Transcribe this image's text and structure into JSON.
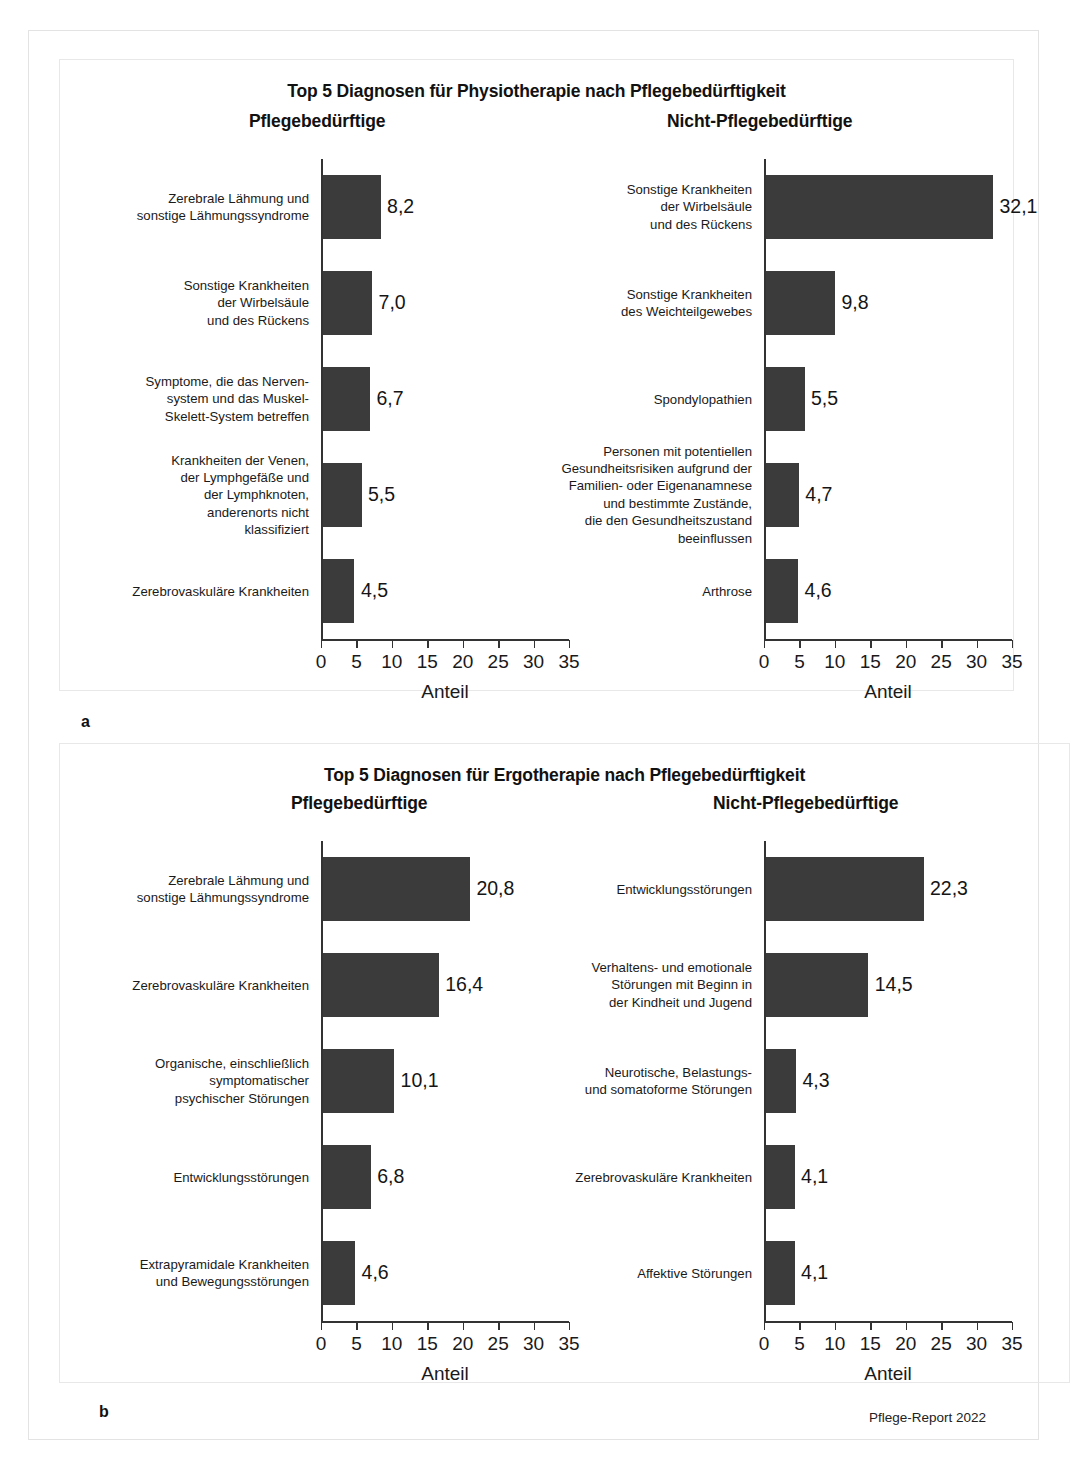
{
  "figure": {
    "source_note": "Pflege-Report 2022",
    "panel_a_letter": "a",
    "panel_b_letter": "b",
    "axis_title": "Anteil",
    "tick_labels": [
      "0",
      "5",
      "10",
      "15",
      "20",
      "25",
      "30",
      "35"
    ],
    "group_left": "Pflegebedürftige",
    "group_right": "Nicht-Pflegebedürftige",
    "bar_color": "#3b3b3b",
    "axis_color": "#333333"
  },
  "chart_data": [
    {
      "type": "bar",
      "orientation": "horizontal",
      "panel": "a",
      "subpanel": "left",
      "title": "Top 5 Diagnosen für Physiotherapie nach Pflegebedürftigkeit",
      "subtitle": "Pflegebedürftige",
      "xlabel": "Anteil",
      "ylabel": "",
      "xlim": [
        0,
        35
      ],
      "xticks": [
        0,
        5,
        10,
        15,
        20,
        25,
        30,
        35
      ],
      "grid": false,
      "legend": null,
      "categories": [
        "Zerebrale Lähmung und\nsonstige Lähmungssyndrome",
        "Sonstige Krankheiten\nder Wirbelsäule\nund des Rückens",
        "Symptome, die das Nerven-\nsystem und das Muskel-\nSkelett-System betreffen",
        "Krankheiten der Venen,\nder Lymphgefäße und\nder Lymphknoten,\nanderenorts nicht\nklassifiziert",
        "Zerebrovaskuläre Krankheiten"
      ],
      "values": [
        8.2,
        7.0,
        6.7,
        5.5,
        4.5
      ],
      "value_labels": [
        "8,2",
        "7,0",
        "6,7",
        "5,5",
        "4,5"
      ]
    },
    {
      "type": "bar",
      "orientation": "horizontal",
      "panel": "a",
      "subpanel": "right",
      "title": "Top 5 Diagnosen für Physiotherapie nach Pflegebedürftigkeit",
      "subtitle": "Nicht-Pflegebedürftige",
      "xlabel": "Anteil",
      "ylabel": "",
      "xlim": [
        0,
        35
      ],
      "xticks": [
        0,
        5,
        10,
        15,
        20,
        25,
        30,
        35
      ],
      "grid": false,
      "legend": null,
      "categories": [
        "Sonstige Krankheiten\nder Wirbelsäule\nund des Rückens",
        "Sonstige Krankheiten\ndes Weichteilgewebes",
        "Spondylopathien",
        "Personen mit potentiellen\nGesundheitsrisiken aufgrund der\nFamilien- oder Eigenanamnese\nund bestimmte Zustände,\ndie den Gesundheitszustand\nbeeinflussen",
        "Arthrose"
      ],
      "values": [
        32.1,
        9.8,
        5.5,
        4.7,
        4.6
      ],
      "value_labels": [
        "32,1",
        "9,8",
        "5,5",
        "4,7",
        "4,6"
      ]
    },
    {
      "type": "bar",
      "orientation": "horizontal",
      "panel": "b",
      "subpanel": "left",
      "title": "Top 5 Diagnosen für Ergotherapie nach Pflegebedürftigkeit",
      "subtitle": "Pflegebedürftige",
      "xlabel": "Anteil",
      "ylabel": "",
      "xlim": [
        0,
        35
      ],
      "xticks": [
        0,
        5,
        10,
        15,
        20,
        25,
        30,
        35
      ],
      "grid": false,
      "legend": null,
      "categories": [
        "Zerebrale Lähmung und\nsonstige Lähmungssyndrome",
        "Zerebrovaskuläre Krankheiten",
        "Organische, einschließlich\nsymptomatischer\npsychischer Störungen",
        "Entwicklungsstörungen",
        "Extrapyramidale Krankheiten\nund Bewegungsstörungen"
      ],
      "values": [
        20.8,
        16.4,
        10.1,
        6.8,
        4.6
      ],
      "value_labels": [
        "20,8",
        "16,4",
        "10,1",
        "6,8",
        "4,6"
      ]
    },
    {
      "type": "bar",
      "orientation": "horizontal",
      "panel": "b",
      "subpanel": "right",
      "title": "Top 5 Diagnosen für Ergotherapie nach Pflegebedürftigkeit",
      "subtitle": "Nicht-Pflegebedürftige",
      "xlabel": "Anteil",
      "ylabel": "",
      "xlim": [
        0,
        35
      ],
      "xticks": [
        0,
        5,
        10,
        15,
        20,
        25,
        30,
        35
      ],
      "grid": false,
      "legend": null,
      "categories": [
        "Entwicklungsstörungen",
        "Verhaltens- und emotionale\nStörungen mit Beginn in\nder Kindheit und Jugend",
        "Neurotische, Belastungs-\nund somatoforme Störungen",
        "Zerebrovaskuläre Krankheiten",
        "Affektive Störungen"
      ],
      "values": [
        22.3,
        14.5,
        4.3,
        4.1,
        4.1
      ],
      "value_labels": [
        "22,3",
        "14,5",
        "4,3",
        "4,1",
        "4,1"
      ]
    }
  ],
  "panel_a": {
    "title": "Top 5 Diagnosen für Physiotherapie nach Pflegebedürftigkeit"
  },
  "panel_b": {
    "title": "Top 5 Diagnosen für Ergotherapie nach Pflegebedürftigkeit"
  }
}
